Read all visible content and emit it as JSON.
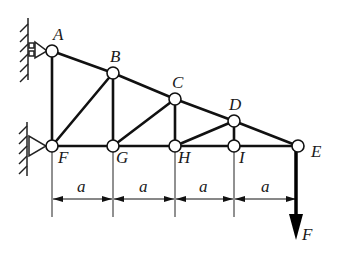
{
  "diagram": {
    "type": "truss",
    "joints": [
      {
        "id": "A",
        "label": "A",
        "x": 52,
        "y": 51,
        "lx": 50,
        "ly": 38
      },
      {
        "id": "B",
        "label": "B",
        "x": 113,
        "y": 73,
        "lx": 110,
        "ly": 60
      },
      {
        "id": "C",
        "label": "C",
        "x": 175,
        "y": 99,
        "lx": 172,
        "ly": 86
      },
      {
        "id": "D",
        "label": "D",
        "x": 234,
        "y": 121,
        "lx": 230,
        "ly": 108
      },
      {
        "id": "E",
        "label": "E",
        "x": 298,
        "y": 146,
        "lx": 312,
        "ly": 156
      },
      {
        "id": "F",
        "label": "F",
        "x": 52,
        "y": 146,
        "lx": 58,
        "ly": 163
      },
      {
        "id": "G",
        "label": "G",
        "x": 113,
        "y": 146,
        "lx": 116,
        "ly": 163
      },
      {
        "id": "H",
        "label": "H",
        "x": 175,
        "y": 146,
        "lx": 180,
        "ly": 163
      },
      {
        "id": "I",
        "label": "I",
        "x": 234,
        "y": 146,
        "lx": 240,
        "ly": 163
      }
    ],
    "members": [
      [
        "A",
        "B"
      ],
      [
        "B",
        "C"
      ],
      [
        "C",
        "D"
      ],
      [
        "D",
        "E"
      ],
      [
        "F",
        "G"
      ],
      [
        "G",
        "H"
      ],
      [
        "H",
        "I"
      ],
      [
        "I",
        "E"
      ],
      [
        "A",
        "F"
      ],
      [
        "B",
        "G"
      ],
      [
        "C",
        "H"
      ],
      [
        "D",
        "I"
      ],
      [
        "F",
        "B"
      ],
      [
        "G",
        "C"
      ],
      [
        "H",
        "D"
      ]
    ],
    "supports": [
      {
        "joint": "A",
        "type": "roller"
      },
      {
        "joint": "F",
        "type": "pin"
      }
    ],
    "load": {
      "joint": "E",
      "label": "F",
      "direction": "down"
    },
    "dimensions": {
      "label": "a",
      "count": 4
    },
    "labels": {
      "A": "A",
      "B": "B",
      "C": "C",
      "D": "D",
      "E": "E",
      "F": "F",
      "G": "G",
      "H": "H",
      "I": "I",
      "load": "F",
      "dim1": "a",
      "dim2": "a",
      "dim3": "a",
      "dim4": "a"
    }
  }
}
